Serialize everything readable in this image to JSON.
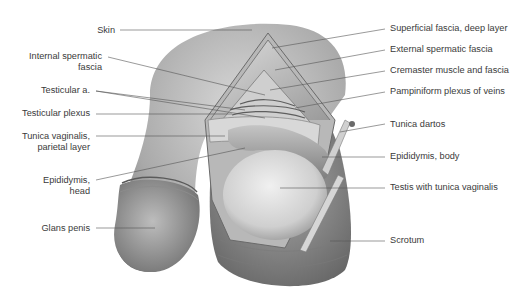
{
  "figure": {
    "labels_left": [
      {
        "id": "skin",
        "text": "Skin",
        "x": 98,
        "y": 25
      },
      {
        "id": "internal-spermatic-fascia",
        "text_lines": [
          "Internal spermatic",
          "fascia"
        ],
        "x": 102,
        "y": 51
      },
      {
        "id": "testicular-artery",
        "text": "Testicular a.",
        "x": 90,
        "y": 85
      },
      {
        "id": "testicular-plexus",
        "text": "Testicular plexus",
        "x": 90,
        "y": 109
      },
      {
        "id": "tunica-vaginalis-parietal",
        "text_lines": [
          "Tunica vaginalis,",
          "parietal layer"
        ],
        "x": 90,
        "y": 131
      },
      {
        "id": "epididymis-head",
        "text_lines": [
          "Epididymis,",
          "head"
        ],
        "x": 90,
        "y": 175
      },
      {
        "id": "glans-penis",
        "text": "Glans penis",
        "x": 90,
        "y": 223
      }
    ],
    "labels_right": [
      {
        "id": "superficial-fascia-deep",
        "text": "Superficial fascia, deep layer",
        "x": 390,
        "y": 24
      },
      {
        "id": "external-spermatic-fascia",
        "text": "External spermatic fascia",
        "x": 390,
        "y": 45
      },
      {
        "id": "cremaster",
        "text": "Cremaster muscle and fascia",
        "x": 390,
        "y": 66
      },
      {
        "id": "pampiniform",
        "text": "Pampiniform plexus of veins",
        "x": 390,
        "y": 87
      },
      {
        "id": "tunica-dartos",
        "text": "Tunica dartos",
        "x": 390,
        "y": 120
      },
      {
        "id": "epididymis-body",
        "text": "Epididymis, body",
        "x": 390,
        "y": 152
      },
      {
        "id": "testis",
        "text": "Testis with tunica vaginalis",
        "x": 390,
        "y": 183
      },
      {
        "id": "scrotum",
        "text": "Scrotum",
        "x": 390,
        "y": 236
      }
    ],
    "colors": {
      "label_text": "#3a3a3a",
      "leader_line": "#555555",
      "skin_mid": "#8a8a8a",
      "background": "#ffffff"
    }
  }
}
